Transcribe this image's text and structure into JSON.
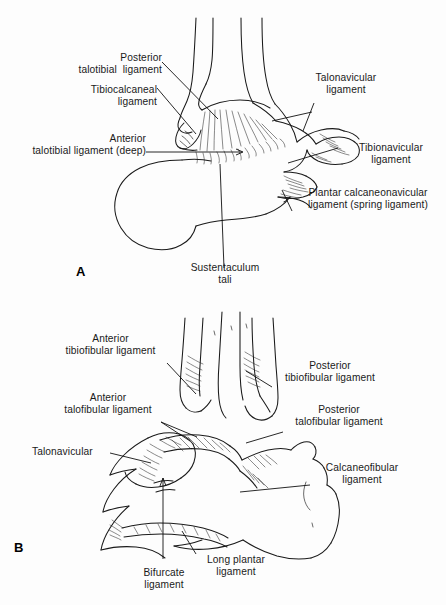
{
  "figure": {
    "background_color": "#fdfdfd",
    "ink_color": "#1a1a1a",
    "panels": [
      {
        "letter": "A",
        "view": "medial-view-ankle",
        "labels": [
          "Posterior\ntalotibial  ligament",
          "Tibiocalcaneal\nligament",
          "Anterior\ntalotibial ligament (deep)",
          "Talonavicular\nligament",
          "Tibionavicular\nligament",
          "Plantar calcaneonavicular\nligament (spring ligament)",
          "Sustentaculum\ntali"
        ]
      },
      {
        "letter": "B",
        "view": "lateral-posterior-view-ankle",
        "labels": [
          "Anterior\ntibiofibular ligament",
          "Anterior\ntalofibular ligament",
          "Talonavicular",
          "Posterior\ntibiofibular ligament",
          "Posterior\ntalofibular ligament",
          "Calcaneofibular\nligament",
          "Bifurcate\nligament",
          "Long plantar\nligament"
        ]
      }
    ]
  },
  "panel_a": {
    "letter": "A",
    "label_posterior_talotibial_l1": "Posterior",
    "label_posterior_talotibial_l2": "talotibial  ligament",
    "label_tibiocalcaneal_l1": "Tibiocalcaneal",
    "label_tibiocalcaneal_l2": "ligament",
    "label_anterior_talotibial_l1": "Anterior",
    "label_anterior_talotibial_l2": "talotibial ligament (deep)",
    "label_talonavicular_l1": "Talonavicular",
    "label_talonavicular_l2": "ligament",
    "label_tibionavicular_l1": "Tibionavicular",
    "label_tibionavicular_l2": "ligament",
    "label_spring_l1": "Plantar calcaneonavicular",
    "label_spring_l2": "ligament (spring ligament)",
    "label_sustentaculum_l1": "Sustentaculum",
    "label_sustentaculum_l2": "tali"
  },
  "panel_b": {
    "letter": "B",
    "label_ant_tibiofibular_l1": "Anterior",
    "label_ant_tibiofibular_l2": "tibiofibular ligament",
    "label_ant_talofibular_l1": "Anterior",
    "label_ant_talofibular_l2": "talofibular ligament",
    "label_talonavicular": "Talonavicular",
    "label_post_tibiofibular_l1": "Posterior",
    "label_post_tibiofibular_l2": "tibiofibular ligament",
    "label_post_talofibular_l1": "Posterior",
    "label_post_talofibular_l2": "talofibular ligament",
    "label_calcaneofibular_l1": "Calcaneofibular",
    "label_calcaneofibular_l2": "ligament",
    "label_bifurcate_l1": "Bifurcate",
    "label_bifurcate_l2": "ligament",
    "label_long_plantar_l1": "Long plantar",
    "label_long_plantar_l2": "ligament"
  }
}
